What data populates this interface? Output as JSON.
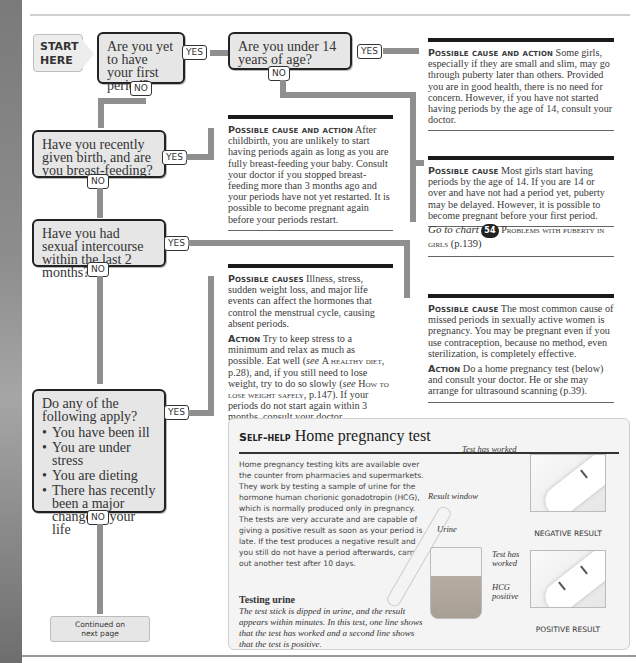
{
  "start": {
    "line1": "START",
    "line2": "HERE"
  },
  "questions": [
    {
      "text": "Are you yet to have your first period?",
      "yes": "YES",
      "no": "NO"
    },
    {
      "text": "Are you under 14 years of age?",
      "yes": "YES",
      "no": "NO"
    },
    {
      "text": "Have you recently given birth, and are you breast-feeding?",
      "yes": "YES",
      "no": "NO"
    },
    {
      "text": "Have you had sexual intercourse within the last 2 months?",
      "yes": "YES",
      "no": "NO"
    },
    {
      "text": "Do any of the following apply?",
      "bullets": [
        "You have been ill",
        "You are under stress",
        "You are dieting",
        "There has recently been a major change in your life"
      ],
      "yes": "YES",
      "no": "NO"
    }
  ],
  "outcomes": {
    "late_puberty": {
      "label": "Possible cause and action",
      "text": "Some girls, especially if they are small and slim, may go through puberty later than others. Provided you are in good health, there is no need for concern. However, if you have not started having periods by the age of 14, consult your doctor."
    },
    "delayed_puberty": {
      "label": "Possible cause",
      "text": "Most girls start having periods by the age of 14. If you are 14 or over and have not had a period yet, puberty may be delayed. However, it is possible to become pregnant before your first period."
    },
    "goto": {
      "prefix": "Go to chart",
      "badge": "54",
      "title": "Problems with puberty in girls",
      "page": "(p.139)"
    },
    "breastfeeding": {
      "label": "Possible cause and action",
      "text": "After childbirth, you are unlikely to start having periods again as long as you are fully breast-feeding your baby. Consult your doctor if you stopped breast-feeding more than 3 months ago and your periods have not yet restarted. It is possible to become pregnant again before your periods restart."
    },
    "pregnancy": {
      "cause_label": "Possible cause",
      "cause_text": "The most common cause of missed periods in sexually active women is pregnancy. You may be pregnant even if you use contraception, because no method, even sterilization, is completely effective.",
      "action_label": "Action",
      "action_text": "Do a home pregnancy test (below) and consult your doctor. He or she may arrange for ultrasound scanning (p.39)."
    },
    "lifestyle": {
      "cause_label": "Possible causes",
      "cause_text": "Illness, stress, sudden weight loss, and major life events can affect the hormones that control the menstrual cycle, causing absent periods.",
      "action_label": "Action",
      "action_text_1": "Try to keep stress to a minimum and relax as much as possible. Eat well (",
      "see1": "see",
      "ref1": "A healthy diet",
      "action_text_2": ", p.28), and, if you still need to lose weight, try to do so slowly (",
      "see2": "see",
      "ref2": "How to lose weight safely",
      "action_text_3": ", p.147). If your periods do not start again within 3 months, consult your doctor."
    }
  },
  "continued": {
    "line1": "Continued on",
    "line2": "next page"
  },
  "self_help": {
    "label": "Self-help",
    "title": "Home pregnancy test",
    "body": "Home pregnancy testing kits are available over the counter from pharmacies and supermarkets. They work by testing a sample of urine for the hormone human chorionic gonadotropin (HCG), which is normally produced only in pregnancy. The tests are very accurate and are capable of giving a positive result as soon as your period is late. If the test produces a negative result and you still do not have a period afterwards, carry out another test after 10 days.",
    "sub_title": "Testing urine",
    "sub_text": "The test stick is dipped in urine, and the result appears within minutes. In this test, one line shows that the test has worked and a second line shows that the test is positive.",
    "labels": {
      "test_worked_top": "Test has worked",
      "result_window": "Result window",
      "urine": "Urine",
      "test_worked_bottom": "Test has worked",
      "hcg_positive": "HCG positive"
    },
    "captions": {
      "negative": "NEGATIVE RESULT",
      "positive": "POSITIVE RESULT"
    }
  }
}
